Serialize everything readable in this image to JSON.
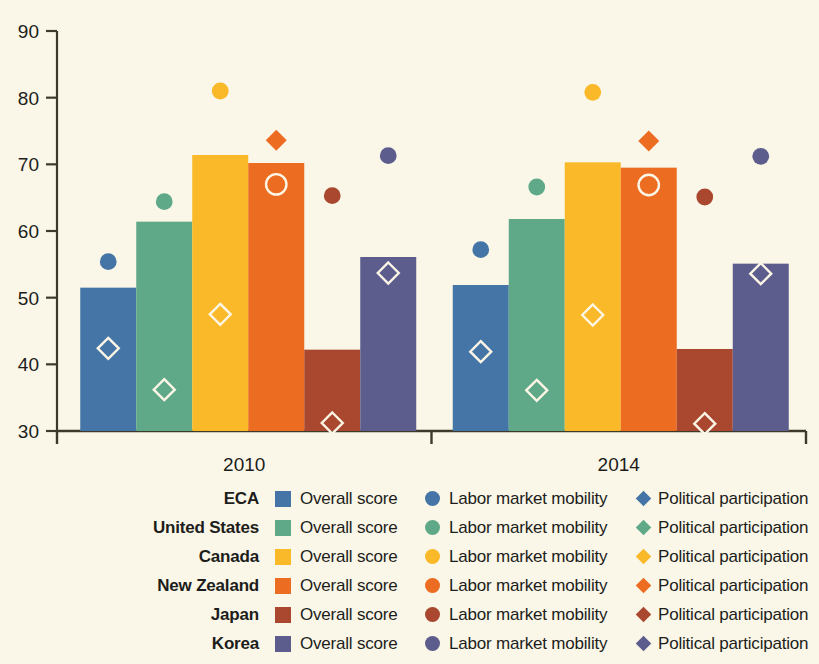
{
  "chart_data": {
    "type": "bar",
    "title": "",
    "subtitle": "",
    "xlabel": "",
    "ylabel": "",
    "ylim": [
      30,
      90
    ],
    "ytick_step": 10,
    "yticks": [
      "30",
      "40",
      "50",
      "60",
      "70",
      "80",
      "90"
    ],
    "grid": false,
    "categories": [
      "2010",
      "2014"
    ],
    "legend_position": "bottom",
    "series_names": [
      "Overall score",
      "Labor market mobility",
      "Political participation"
    ],
    "marker_shapes": {
      "overall_score": "bar",
      "labor_market_mobility": "circle",
      "political_participation": "diamond"
    },
    "groups": [
      {
        "category": "2010",
        "entries": [
          {
            "name": "ECA",
            "color": "#4575a6",
            "overall_score": 51.5,
            "labor_market_mobility": 55.4,
            "political_participation": 42.4,
            "mobility_filled": true,
            "political_filled": false
          },
          {
            "name": "United States",
            "color": "#5fa988",
            "overall_score": 61.4,
            "labor_market_mobility": 64.4,
            "political_participation": 36.2,
            "mobility_filled": true,
            "political_filled": false
          },
          {
            "name": "Canada",
            "color": "#f9b928",
            "overall_score": 71.4,
            "labor_market_mobility": 81.0,
            "political_participation": 47.5,
            "mobility_filled": true,
            "political_filled": false
          },
          {
            "name": "New Zealand",
            "color": "#ec6c22",
            "overall_score": 70.2,
            "labor_market_mobility": 67.0,
            "political_participation": 73.6,
            "mobility_filled": false,
            "political_filled": true
          },
          {
            "name": "Japan",
            "color": "#a9482f",
            "overall_score": 42.2,
            "labor_market_mobility": 65.3,
            "political_participation": 31.2,
            "mobility_filled": true,
            "political_filled": false
          },
          {
            "name": "Korea",
            "color": "#5c5d8d",
            "overall_score": 56.1,
            "labor_market_mobility": 71.3,
            "political_participation": 53.7,
            "mobility_filled": true,
            "political_filled": false
          }
        ]
      },
      {
        "category": "2014",
        "entries": [
          {
            "name": "ECA",
            "color": "#4575a6",
            "overall_score": 51.9,
            "labor_market_mobility": 57.2,
            "political_participation": 41.9,
            "mobility_filled": true,
            "political_filled": false
          },
          {
            "name": "United States",
            "color": "#5fa988",
            "overall_score": 61.8,
            "labor_market_mobility": 66.6,
            "political_participation": 36.1,
            "mobility_filled": true,
            "political_filled": false
          },
          {
            "name": "Canada",
            "color": "#f9b928",
            "overall_score": 70.3,
            "labor_market_mobility": 80.8,
            "political_participation": 47.4,
            "mobility_filled": true,
            "political_filled": false
          },
          {
            "name": "New Zealand",
            "color": "#ec6c22",
            "overall_score": 69.5,
            "labor_market_mobility": 66.9,
            "political_participation": 73.5,
            "mobility_filled": false,
            "political_filled": true
          },
          {
            "name": "Japan",
            "color": "#a9482f",
            "overall_score": 42.3,
            "labor_market_mobility": 65.1,
            "political_participation": 31.1,
            "mobility_filled": true,
            "political_filled": false
          },
          {
            "name": "Korea",
            "color": "#5c5d8d",
            "overall_score": 55.1,
            "labor_market_mobility": 71.2,
            "political_participation": 53.6,
            "mobility_filled": true,
            "political_filled": false
          }
        ]
      }
    ]
  },
  "legend": {
    "rows": [
      {
        "country": "ECA",
        "color": "#4575a6",
        "overall": "Overall score",
        "labor": "Labor market mobility",
        "political": "Political participation"
      },
      {
        "country": "United States",
        "color": "#5fa988",
        "overall": "Overall score",
        "labor": "Labor market mobility",
        "political": "Political participation"
      },
      {
        "country": "Canada",
        "color": "#f9b928",
        "overall": "Overall score",
        "labor": "Labor market mobility",
        "political": "Political participation"
      },
      {
        "country": "New Zealand",
        "color": "#ec6c22",
        "overall": "Overall score",
        "labor": "Labor market mobility",
        "political": "Political participation"
      },
      {
        "country": "Japan",
        "color": "#a9482f",
        "overall": "Overall score",
        "labor": "Labor market mobility",
        "political": "Political participation"
      },
      {
        "country": "Korea",
        "color": "#5c5d8d",
        "overall": "Overall score",
        "labor": "Labor market mobility",
        "political": "Political participation"
      }
    ]
  },
  "colors": {
    "background": "#faf7e8",
    "axis": "#3d3a2a",
    "text": "#1d1d1b"
  }
}
